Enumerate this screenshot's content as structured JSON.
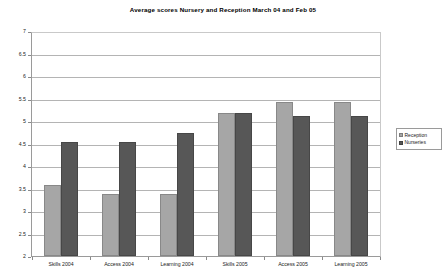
{
  "chart_data": {
    "type": "bar",
    "title": "Average scores Nursery and Reception March 04 and Feb 05",
    "xlabel": "",
    "ylabel": "",
    "ylim": [
      2,
      7
    ],
    "ytick_step": 0.5,
    "grid": true,
    "legend_position": "right",
    "categories": [
      "Skills 2004",
      "Access 2004",
      "Learning 2004",
      "Skills 2005",
      "Access 2005",
      "Learning 2005"
    ],
    "yticks": [
      "2",
      "2.5",
      "3",
      "3.5",
      "4",
      "4.5",
      "5",
      "5.5",
      "6",
      "6.5",
      "7"
    ],
    "series": [
      {
        "name": "Reception",
        "color": "#a6a6a6",
        "values": [
          3.6,
          3.4,
          3.4,
          5.2,
          5.45,
          5.45
        ]
      },
      {
        "name": "Nurseries",
        "color": "#575757",
        "values": [
          4.55,
          4.55,
          4.75,
          5.2,
          5.15,
          5.15
        ]
      }
    ]
  },
  "legend": {
    "items": [
      {
        "label": "Reception",
        "color": "#a6a6a6"
      },
      {
        "label": "Nurseries",
        "color": "#575757"
      }
    ]
  },
  "colors": {
    "reception": "#a6a6a6",
    "nurseries": "#575757",
    "gridline": "#b4b4b4",
    "axis": "#9a9a9a",
    "background": "#ffffff"
  }
}
